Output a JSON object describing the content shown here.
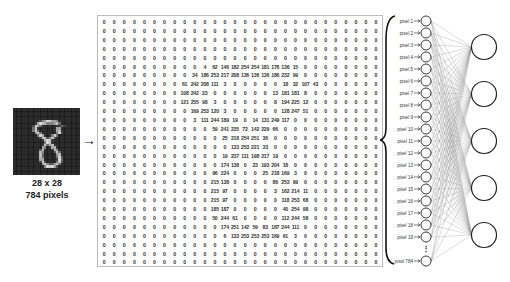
{
  "caption": {
    "dims": "28 x 28",
    "count": "784 pixels"
  },
  "arrow": "→",
  "matrix": {
    "size": 28,
    "nonzero": [
      {
        "row": 5,
        "start": 10,
        "values": [
          4,
          62,
          146,
          182,
          254,
          254,
          181,
          176,
          136,
          15
        ]
      },
      {
        "row": 6,
        "start": 9,
        "values": [
          34,
          186,
          253,
          217,
          208,
          136,
          136,
          136,
          186,
          232,
          99
        ]
      },
      {
        "row": 7,
        "start": 8,
        "values": [
          61,
          242,
          208,
          111,
          3,
          0,
          0,
          0,
          0,
          0,
          18,
          32,
          107,
          43
        ]
      },
      {
        "row": 8,
        "start": 8,
        "values": [
          108,
          242,
          23,
          0,
          0,
          0,
          0,
          0,
          0,
          13,
          181,
          181,
          8
        ]
      },
      {
        "row": 9,
        "start": 8,
        "values": [
          121,
          255,
          98,
          3,
          0,
          0,
          0,
          0,
          0,
          8,
          194,
          225,
          12
        ]
      },
      {
        "row": 10,
        "start": 9,
        "values": [
          169,
          253,
          120,
          3,
          0,
          0,
          0,
          0,
          0,
          128,
          247,
          51
        ]
      },
      {
        "row": 11,
        "start": 9,
        "values": [
          3,
          111,
          244,
          189,
          19,
          0,
          14,
          131,
          249,
          117
        ]
      },
      {
        "row": 12,
        "start": 11,
        "values": [
          59,
          241,
          235,
          72,
          142,
          229,
          66
        ]
      },
      {
        "row": 13,
        "start": 12,
        "values": [
          25,
          218,
          254,
          251,
          36
        ]
      },
      {
        "row": 14,
        "start": 13,
        "values": [
          133,
          253,
          221,
          33
        ]
      },
      {
        "row": 15,
        "start": 12,
        "values": [
          19,
          237,
          111,
          198,
          217,
          19
        ]
      },
      {
        "row": 16,
        "start": 12,
        "values": [
          174,
          138,
          0,
          23,
          193,
          204,
          18
        ]
      },
      {
        "row": 17,
        "start": 11,
        "values": [
          96,
          224,
          0,
          0,
          0,
          25,
          218,
          169,
          3
        ]
      },
      {
        "row": 18,
        "start": 11,
        "values": [
          215,
          138,
          0,
          0,
          0,
          0,
          86,
          253,
          99
        ]
      },
      {
        "row": 19,
        "start": 11,
        "values": [
          215,
          97,
          0,
          0,
          0,
          0,
          3,
          162,
          214,
          11
        ]
      },
      {
        "row": 20,
        "start": 11,
        "values": [
          215,
          97,
          0,
          0,
          0,
          0,
          0,
          118,
          253,
          68
        ]
      },
      {
        "row": 21,
        "start": 11,
        "values": [
          185,
          187,
          0,
          0,
          0,
          0,
          0,
          40,
          254,
          98
        ]
      },
      {
        "row": 22,
        "start": 11,
        "values": [
          50,
          244,
          61,
          0,
          0,
          0,
          0,
          112,
          244,
          58
        ]
      },
      {
        "row": 23,
        "start": 12,
        "values": [
          174,
          251,
          142,
          59,
          83,
          187,
          244,
          111
        ]
      },
      {
        "row": 24,
        "start": 12,
        "values": [
          6,
          133,
          253,
          253,
          253,
          169,
          61,
          3
        ]
      }
    ]
  },
  "network": {
    "input_labels": [
      "pixel 1",
      "pixel 2",
      "pixel 3",
      "pixel 4",
      "pixel 5",
      "pixel 6",
      "pixel 7",
      "pixel 8",
      "pixel 9",
      "pixel 10",
      "pixel 11",
      "pixel 12",
      "pixel 13",
      "pixel 14",
      "pixel 15",
      "pixel 16",
      "pixel 17",
      "pixel 18",
      "pixel 19"
    ],
    "last_label": "pixel 784",
    "ellipsis": "⋮",
    "hidden_nodes": 5
  }
}
